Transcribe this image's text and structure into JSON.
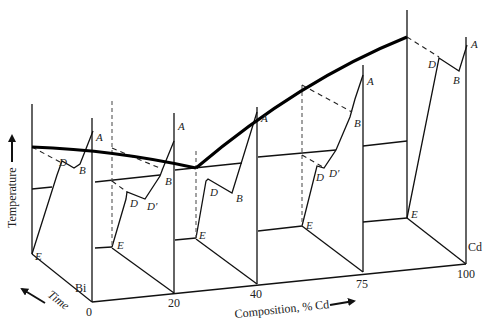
{
  "diagram": {
    "type": "3d cooling-curve diagram (Bi–Cd phase diagram construction)",
    "axes": {
      "vertical_label": "Temperature",
      "depth_label": "Time",
      "horizontal_label": "Composition, % Cd"
    },
    "end_labels": {
      "left": "Bi",
      "right": "Cd"
    },
    "ticks": [
      "0",
      "20",
      "40",
      "75",
      "100"
    ],
    "point_labels": {
      "A": "A",
      "B": "B",
      "D": "D",
      "Dp": "D′",
      "E": "E"
    },
    "panels": [
      {
        "composition": "0",
        "labels": [
          "A",
          "B",
          "D",
          "E"
        ]
      },
      {
        "composition": "20",
        "labels": [
          "A",
          "B",
          "D",
          "D′",
          "E"
        ]
      },
      {
        "composition": "40",
        "labels": [
          "A",
          "B",
          "D",
          "E"
        ]
      },
      {
        "composition": "75",
        "labels": [
          "A",
          "B",
          "D",
          "D′",
          "E"
        ]
      },
      {
        "composition": "100",
        "labels": [
          "A",
          "B",
          "D",
          "E"
        ]
      }
    ]
  }
}
